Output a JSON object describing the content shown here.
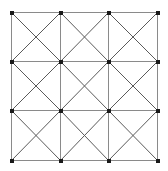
{
  "chart_data": {
    "type": "diagram",
    "subtitle": "",
    "xlabel": "",
    "ylabel": "",
    "grid": true,
    "legend": null,
    "rows": 3,
    "columns": 3,
    "cell_count": 9,
    "pattern": "each-cell-full-X-diagonals",
    "geometry": {
      "x_min": 11,
      "x_max": 157,
      "y_min": 12,
      "y_max": 160,
      "x_gridlines": [
        11,
        60,
        108,
        157
      ],
      "y_gridlines": [
        12,
        61,
        110,
        160
      ],
      "cell_width": 48.67,
      "cell_height": 49.33
    },
    "cells": [
      {
        "row": 0,
        "col": 0,
        "diagonals": "both"
      },
      {
        "row": 0,
        "col": 1,
        "diagonals": "both"
      },
      {
        "row": 0,
        "col": 2,
        "diagonals": "both"
      },
      {
        "row": 1,
        "col": 0,
        "diagonals": "both"
      },
      {
        "row": 1,
        "col": 1,
        "diagonals": "both"
      },
      {
        "row": 1,
        "col": 2,
        "diagonals": "both"
      },
      {
        "row": 2,
        "col": 0,
        "diagonals": "both"
      },
      {
        "row": 2,
        "col": 1,
        "diagonals": "both"
      },
      {
        "row": 2,
        "col": 2,
        "diagonals": "both"
      }
    ],
    "lattice_nodes": [
      {
        "x": 11,
        "y": 12
      },
      {
        "x": 60,
        "y": 12
      },
      {
        "x": 108,
        "y": 12
      },
      {
        "x": 157,
        "y": 12
      },
      {
        "x": 11,
        "y": 61
      },
      {
        "x": 60,
        "y": 61
      },
      {
        "x": 108,
        "y": 61
      },
      {
        "x": 157,
        "y": 61
      },
      {
        "x": 11,
        "y": 110
      },
      {
        "x": 60,
        "y": 110
      },
      {
        "x": 108,
        "y": 110
      },
      {
        "x": 157,
        "y": 110
      },
      {
        "x": 11,
        "y": 160
      },
      {
        "x": 60,
        "y": 160
      },
      {
        "x": 108,
        "y": 160
      },
      {
        "x": 157,
        "y": 160
      }
    ],
    "node_count": 16,
    "node_marker": "filled-square",
    "node_size": 4,
    "triangle_count": 36,
    "colors": {
      "background": "#ffffff",
      "grid_line": "#8a8a8a",
      "diagonal_line": "#5a5a5a",
      "node": "#1a1a1a"
    }
  }
}
